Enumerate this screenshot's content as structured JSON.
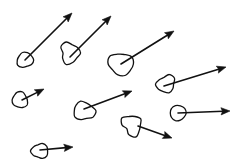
{
  "diagram": {
    "type": "hand-drawn vector field of particles",
    "stroke_color": "#111111",
    "background": "#ffffff",
    "particles": [
      {
        "id": 1,
        "cx": 25,
        "cy": 60,
        "r": 8,
        "wobble": 0.12,
        "arrow": {
          "x1": 25,
          "y1": 60,
          "x2": 72,
          "y2": 13
        }
      },
      {
        "id": 2,
        "cx": 70,
        "cy": 53,
        "r": 10,
        "wobble": 0.25,
        "arrow": {
          "x1": 70,
          "y1": 57,
          "x2": 111,
          "y2": 16
        }
      },
      {
        "id": 3,
        "cx": 121,
        "cy": 64,
        "r": 12,
        "wobble": 0.14,
        "arrow": {
          "x1": 121,
          "y1": 64,
          "x2": 174,
          "y2": 31
        }
      },
      {
        "id": 4,
        "cx": 166,
        "cy": 84,
        "r": 9,
        "wobble": 0.2,
        "arrow": {
          "x1": 164,
          "y1": 86,
          "x2": 226,
          "y2": 67
        }
      },
      {
        "id": 5,
        "cx": 20,
        "cy": 100,
        "r": 8,
        "wobble": 0.12,
        "arrow": {
          "x1": 22,
          "y1": 100,
          "x2": 44,
          "y2": 89
        }
      },
      {
        "id": 6,
        "cx": 84,
        "cy": 111,
        "r": 10,
        "wobble": 0.18,
        "arrow": {
          "x1": 84,
          "y1": 109,
          "x2": 132,
          "y2": 91
        }
      },
      {
        "id": 7,
        "cx": 178,
        "cy": 113,
        "r": 8,
        "wobble": 0.05,
        "arrow": {
          "x1": 178,
          "y1": 113,
          "x2": 230,
          "y2": 111
        }
      },
      {
        "id": 8,
        "cx": 132,
        "cy": 125,
        "r": 10,
        "wobble": 0.28,
        "arrow": {
          "x1": 138,
          "y1": 126,
          "x2": 172,
          "y2": 138
        }
      },
      {
        "id": 9,
        "cx": 40,
        "cy": 151,
        "r": 8,
        "wobble": 0.15,
        "arrow": {
          "x1": 40,
          "y1": 150,
          "x2": 73,
          "y2": 147
        }
      }
    ]
  }
}
